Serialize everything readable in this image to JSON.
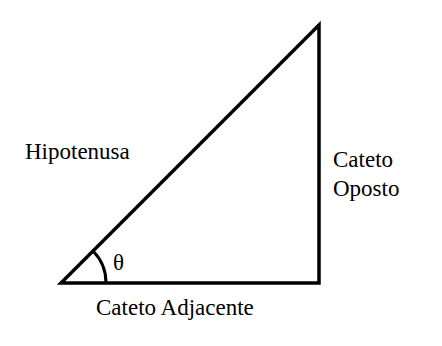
{
  "diagram": {
    "type": "right-triangle",
    "labels": {
      "hypotenuse": "Hipotenusa",
      "opposite_line1": "Cateto",
      "opposite_line2": "Oposto",
      "adjacent": "Cateto Adjacente",
      "angle": "θ"
    },
    "colors": {
      "stroke": "#000000",
      "background": "#ffffff"
    }
  }
}
